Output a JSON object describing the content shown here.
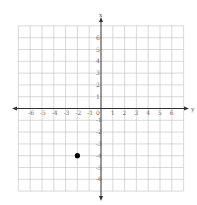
{
  "chart_data": {
    "type": "scatter",
    "title": "",
    "xlabel": "y",
    "ylabel": "x",
    "horizontal_axis_label": "y",
    "vertical_axis_label": "x",
    "xlim": [
      -7,
      7
    ],
    "ylim": [
      -7,
      7
    ],
    "x_ticks": [
      "-6",
      "-5",
      "-4",
      "-3",
      "-2",
      "-1",
      "0",
      "1",
      "2",
      "3",
      "4",
      "5",
      "6"
    ],
    "y_ticks": [
      "6",
      "5",
      "4",
      "3",
      "2",
      "1",
      "-1",
      "-2",
      "-3",
      "-4",
      "-5",
      "-6"
    ],
    "grid": true,
    "legend": "none",
    "points": [
      {
        "h": -2,
        "v": -4
      }
    ]
  },
  "colors": {
    "grid": "#c8c8c8",
    "axis": "#333333",
    "point": "#000000"
  }
}
